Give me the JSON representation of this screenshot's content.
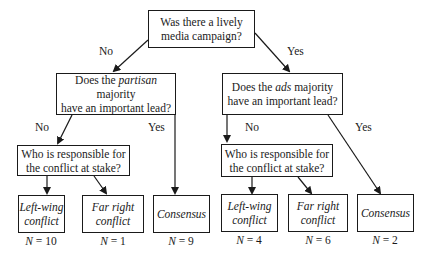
{
  "diagram": {
    "type": "decision-tree",
    "root": {
      "question": "Was there a lively media campaign?",
      "line1": "Was there a lively",
      "line2": "media campaign?"
    },
    "edge_labels": {
      "root_no": "No",
      "root_yes": "Yes",
      "left_no": "No",
      "left_yes": "Yes",
      "right_no": "No",
      "right_yes": "Yes"
    },
    "left_branch": {
      "question_pre": "Does the ",
      "question_em": "partisan",
      "question_post": " majority",
      "question_line2": "have an important lead?",
      "sub_question": {
        "line1": "Who is responsible for",
        "line2": "the conflict at stake?"
      },
      "leaves": [
        {
          "line1": "Left-wing",
          "line2": "conflict",
          "n_label": "N",
          "n_value": "= 10"
        },
        {
          "line1": "Far right",
          "line2": "conflict",
          "n_label": "N",
          "n_value": "= 1"
        },
        {
          "line1": "Consensus",
          "line2": "",
          "n_label": "N",
          "n_value": "= 9"
        }
      ]
    },
    "right_branch": {
      "question_pre": "Does the ",
      "question_em": "ads",
      "question_post": " majority",
      "question_line2": "have an important lead?",
      "sub_question": {
        "line1": "Who is responsible for",
        "line2": "the conflict at stake?"
      },
      "leaves": [
        {
          "line1": "Left-wing",
          "line2": "conflict",
          "n_label": "N",
          "n_value": "= 4"
        },
        {
          "line1": "Far right",
          "line2": "conflict",
          "n_label": "N",
          "n_value": "= 6"
        },
        {
          "line1": "Consensus",
          "line2": "",
          "n_label": "N",
          "n_value": "= 2"
        }
      ]
    }
  }
}
